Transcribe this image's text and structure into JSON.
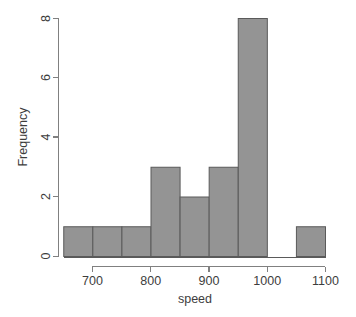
{
  "chart_data": {
    "type": "bar",
    "title": "",
    "subtitle": "",
    "xlabel": "speed",
    "ylabel": "Frequency",
    "xlim": [
      650,
      1100
    ],
    "ylim": [
      0,
      8
    ],
    "grid": false,
    "legend": null,
    "bin_width": 50,
    "bin_edges": [
      650,
      700,
      750,
      800,
      850,
      900,
      950,
      1000,
      1050,
      1100
    ],
    "categories": [
      "650-700",
      "700-750",
      "750-800",
      "800-850",
      "850-900",
      "900-950",
      "950-1000",
      "1000-1050",
      "1050-1100"
    ],
    "values": [
      1,
      1,
      1,
      3,
      2,
      3,
      8,
      0,
      1
    ],
    "x_ticks": [
      700,
      800,
      900,
      1000,
      1100
    ],
    "x_tick_labels": [
      "700",
      "800",
      "900",
      "1000",
      "1100"
    ],
    "y_ticks": [
      0,
      2,
      4,
      6,
      8
    ],
    "y_tick_labels": [
      "0",
      "2",
      "4",
      "6",
      "8"
    ],
    "bar_fill_color": "#949494",
    "bar_border_color": "#5a5a5a",
    "axis_color": "#808080",
    "text_color": "#3d3d3d",
    "background_color": "#ffffff"
  },
  "axis": {
    "x_title": "speed",
    "y_title": "Frequency"
  },
  "x_tick_labels": {
    "t0": "700",
    "t1": "800",
    "t2": "900",
    "t3": "1000",
    "t4": "1100"
  },
  "y_tick_labels": {
    "t0": "0",
    "t1": "2",
    "t2": "4",
    "t3": "6",
    "t4": "8"
  }
}
